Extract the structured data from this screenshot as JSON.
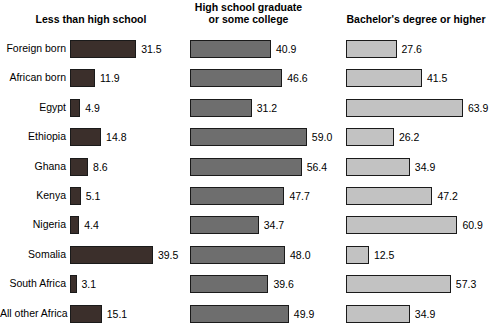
{
  "chart_data": {
    "type": "bar",
    "orientation": "horizontal",
    "title": "",
    "subtitle": "",
    "xlabel": "",
    "ylabel": "",
    "grid": false,
    "legend_position": "none",
    "panels": [
      {
        "label": "Less than high school",
        "color": "#3b2f2b",
        "xlim": [
          0,
          70
        ]
      },
      {
        "label": "High school graduate or some college",
        "color": "#6e6e6e",
        "xlim": [
          0,
          70
        ]
      },
      {
        "label": "Bachelor's degree or higher",
        "color": "#c2c2c2",
        "xlim": [
          0,
          70
        ]
      }
    ],
    "panel_label_lines": [
      [
        "Less than high school"
      ],
      [
        "High school graduate",
        "or some college"
      ],
      [
        "Bachelor's degree or higher"
      ]
    ],
    "categories": [
      "Foreign born",
      "African born",
      "Egypt",
      "Ethiopia",
      "Ghana",
      "Kenya",
      "Nigeria",
      "Somalia",
      "South Africa",
      "All other Africa"
    ],
    "series": [
      {
        "name": "Less than high school",
        "values": [
          31.5,
          11.9,
          4.9,
          14.8,
          8.6,
          5.1,
          4.4,
          39.5,
          3.1,
          15.1
        ],
        "labels": [
          "31.5",
          "11.9",
          "4.9",
          "14.8",
          "8.6",
          "5.1",
          "4.4",
          "39.5",
          "3.1",
          "15.1"
        ]
      },
      {
        "name": "High school graduate or some college",
        "values": [
          40.9,
          46.6,
          31.2,
          59.0,
          56.4,
          47.7,
          34.7,
          48.0,
          39.6,
          49.9
        ],
        "labels": [
          "40.9",
          "46.6",
          "31.2",
          "59.0",
          "56.4",
          "47.7",
          "34.7",
          "48.0",
          "39.6",
          "49.9"
        ]
      },
      {
        "name": "Bachelor's degree or higher",
        "values": [
          27.6,
          41.5,
          63.9,
          26.2,
          34.9,
          47.2,
          60.9,
          12.5,
          57.3,
          34.9
        ],
        "labels": [
          "27.6",
          "41.5",
          "63.9",
          "26.2",
          "34.9",
          "47.2",
          "60.9",
          "12.5",
          "57.3",
          "34.9"
        ]
      }
    ]
  }
}
